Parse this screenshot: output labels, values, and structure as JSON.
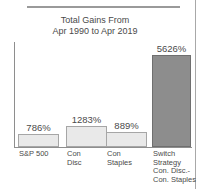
{
  "chart_data": {
    "type": "bar",
    "title": "Total Gains From Apr 1990 to Apr 2019",
    "title_lines": [
      "Total Gains From",
      "Apr 1990 to Apr 2019"
    ],
    "categories": [
      "S&P 500",
      "Con Disc",
      "Con Staples",
      "Switch Strategy Con. Disc.- Con. Staples"
    ],
    "category_lines": [
      [
        "S&P 500"
      ],
      [
        "Con",
        "Disc"
      ],
      [
        "Con",
        "Staples"
      ],
      [
        "Switch",
        "Strategy",
        "Con. Disc.-",
        "Con. Staples"
      ]
    ],
    "values": [
      786,
      1283,
      889,
      5626
    ],
    "value_labels": [
      "786%",
      "1283%",
      "889%",
      "5626%"
    ],
    "xlabel": "",
    "ylabel": "",
    "ylim": [
      0,
      6400
    ],
    "grid": false,
    "legend": false,
    "highlight_index": 3,
    "colors": {
      "bar_fill": "#e9e9e9",
      "bar_border": "#a6a6a6",
      "highlight_fill": "#8d8d8d",
      "highlight_border": "#6f6f6f",
      "axis": "#8e8e8e",
      "text": "#4a4a4a",
      "rule": "#9a9a9a"
    }
  }
}
